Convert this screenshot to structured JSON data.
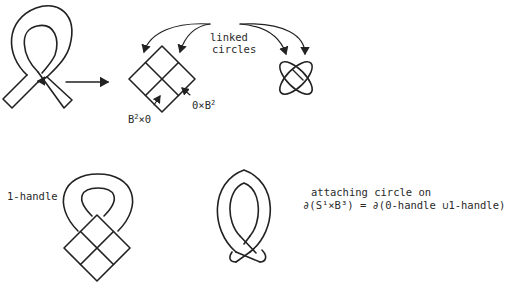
{
  "figure": {
    "top_left": {
      "description": "ribbon loop (1-handle band crossing itself) with small arrow at crossing",
      "arrow_to": "plumbing square"
    },
    "top_middle": {
      "labels": {
        "linked_line1": "linked",
        "linked_line2": "circles",
        "zero_b2": "0×B",
        "zero_b2_sup": "2",
        "b2_zero": "B",
        "b2_zero_sup": "2",
        "b2_zero_tail": "×0"
      }
    },
    "top_right": {
      "description": "Hopf link of two linked circles"
    },
    "bottom_left": {
      "label": "1-handle"
    },
    "bottom_right": {
      "caption_line1": "attaching circle on",
      "caption_line2": "∂(S¹×B³) = ∂(0-handle ∪1-handle)"
    }
  },
  "colors": {
    "stroke": "#222222",
    "background": "#ffffff"
  }
}
